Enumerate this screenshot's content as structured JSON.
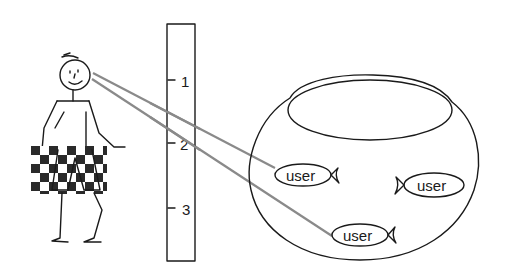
{
  "diagram": {
    "figure": {
      "label": "observer",
      "shorts_pattern": "checkered"
    },
    "scale": {
      "ticks": [
        {
          "label": "1"
        },
        {
          "label": "2"
        },
        {
          "label": "3"
        }
      ]
    },
    "fishbowl": {
      "fish": [
        {
          "label": "user",
          "facing": "left"
        },
        {
          "label": "user",
          "facing": "right"
        },
        {
          "label": "user",
          "facing": "left"
        }
      ]
    },
    "sight_lines": [
      {
        "from": "observer-eye",
        "to": "fish-0"
      },
      {
        "from": "observer-eye",
        "to": "fish-2"
      }
    ],
    "colors": {
      "ink": "#1a1a1a",
      "sight_line": "#8a8a8a",
      "check_dark": "#2a2a2a",
      "background": "#ffffff"
    }
  }
}
